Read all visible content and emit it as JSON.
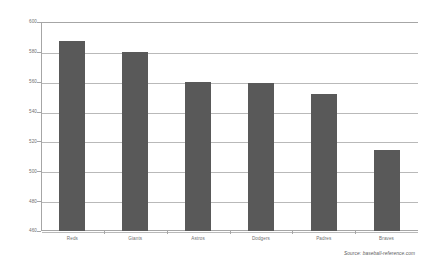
{
  "chart_data": {
    "type": "bar",
    "title": "",
    "subtitle": "",
    "xlabel": "",
    "ylabel": "",
    "categories": [
      "Reds",
      "Giants",
      "Astros",
      "Dodgers",
      "Padres",
      "Braves"
    ],
    "values": [
      587,
      580,
      560,
      559,
      552,
      514
    ],
    "series": [
      {
        "name": "Runs Scored",
        "values": [
          587,
          580,
          560,
          559,
          552,
          514
        ]
      }
    ],
    "ylim": [
      460,
      600
    ],
    "ytick_labels": [
      "600",
      "580",
      "560",
      "540",
      "520",
      "500",
      "480",
      "460"
    ],
    "yticks": [
      600,
      580,
      560,
      540,
      520,
      500,
      480,
      460
    ],
    "grid": true,
    "legend": false,
    "legend_position": "none",
    "bar_color": "#595959",
    "gridline_color": "#b9b9b9",
    "axis_color": "#a6a6a6",
    "label_color": "#6f6f6f",
    "background": "#ffffff",
    "annotations": [
      {
        "name": "source",
        "text": "Source:  baseball-reference.com"
      }
    ]
  },
  "source": {
    "text": "Source:  baseball-reference.com"
  }
}
